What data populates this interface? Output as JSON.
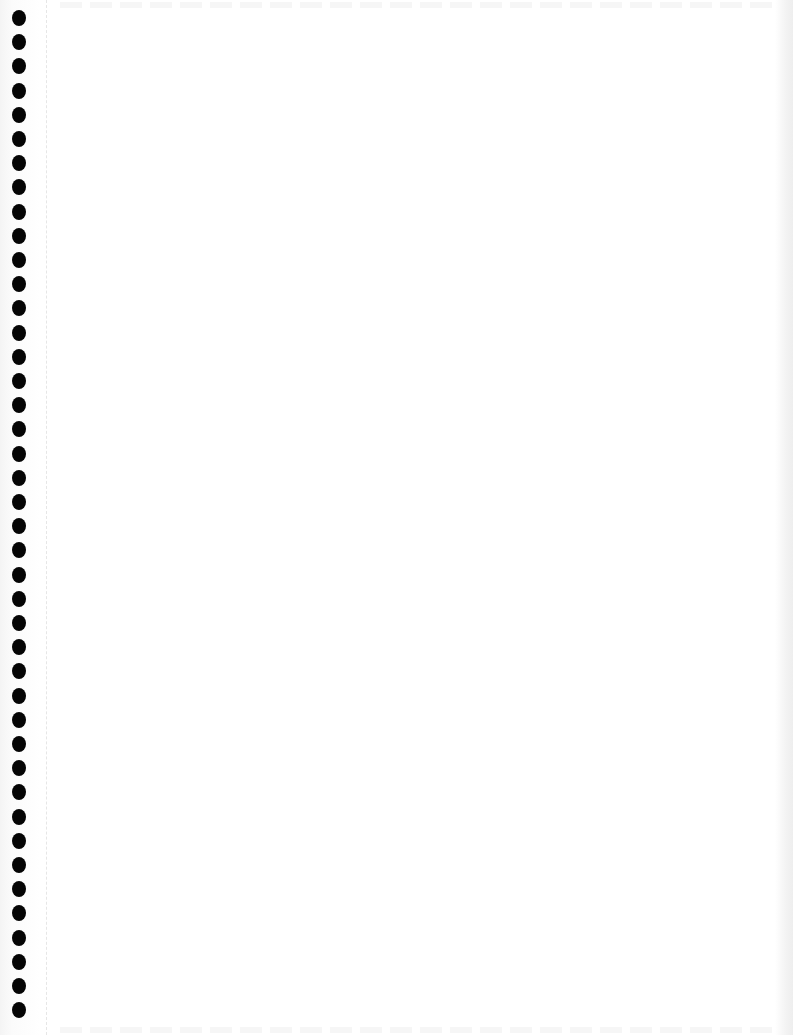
{
  "page": {
    "type": "scanned blank spiral notebook page",
    "background_color": "#ffffff",
    "hole_color": "#050505",
    "binding_holes": {
      "count": 42,
      "side": "left",
      "first_center_y": 18,
      "spacing_px": 24.2
    },
    "content_text": ""
  }
}
